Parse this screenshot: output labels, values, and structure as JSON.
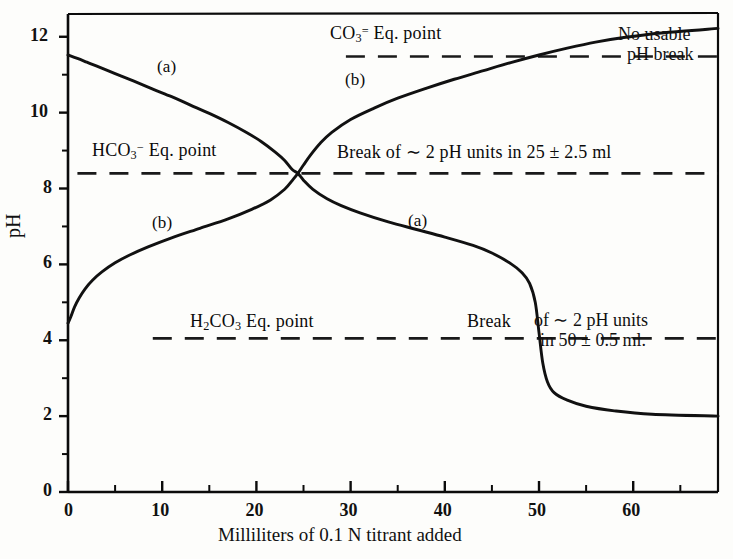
{
  "chart_data": {
    "type": "line",
    "title": "",
    "xlabel": "Milliliters of 0.1 N titrant added",
    "ylabel": "pH",
    "xlim": [
      0,
      69
    ],
    "ylim": [
      0,
      12.6
    ],
    "xticks": [
      0,
      10,
      20,
      30,
      40,
      50,
      60
    ],
    "xtick_labels": [
      "0",
      "10",
      "20",
      "30",
      "40",
      "50",
      "60"
    ],
    "yticks": [
      0,
      2,
      4,
      6,
      8,
      10,
      12
    ],
    "ytick_labels": [
      "0",
      "2",
      "4",
      "6",
      "8",
      "10",
      "12"
    ],
    "minor_xtick_step": 5,
    "minor_ytick_step": 1,
    "grid": false,
    "legend": "inline-curve-labels",
    "series": [
      {
        "name": "(a) titration of carbonate with acid",
        "label": "(a)",
        "label_positions": [
          {
            "x": 16.5,
            "y": 10.85
          },
          {
            "x": 37.5,
            "y": 7.35
          }
        ],
        "points": [
          {
            "x": 0.0,
            "y": 11.52
          },
          {
            "x": 1.0,
            "y": 11.43
          },
          {
            "x": 2.0,
            "y": 11.33
          },
          {
            "x": 3.0,
            "y": 11.23
          },
          {
            "x": 5.0,
            "y": 11.03
          },
          {
            "x": 7.0,
            "y": 10.83
          },
          {
            "x": 9.0,
            "y": 10.62
          },
          {
            "x": 11.0,
            "y": 10.42
          },
          {
            "x": 13.0,
            "y": 10.2
          },
          {
            "x": 15.0,
            "y": 9.98
          },
          {
            "x": 17.0,
            "y": 9.74
          },
          {
            "x": 19.0,
            "y": 9.47
          },
          {
            "x": 20.5,
            "y": 9.24
          },
          {
            "x": 22.0,
            "y": 8.96
          },
          {
            "x": 23.0,
            "y": 8.74
          },
          {
            "x": 23.8,
            "y": 8.5
          },
          {
            "x": 24.4,
            "y": 8.4
          },
          {
            "x": 25.0,
            "y": 8.22
          },
          {
            "x": 26.0,
            "y": 7.98
          },
          {
            "x": 27.5,
            "y": 7.73
          },
          {
            "x": 29.0,
            "y": 7.55
          },
          {
            "x": 31.0,
            "y": 7.36
          },
          {
            "x": 34.0,
            "y": 7.12
          },
          {
            "x": 37.0,
            "y": 6.92
          },
          {
            "x": 40.0,
            "y": 6.72
          },
          {
            "x": 43.0,
            "y": 6.5
          },
          {
            "x": 45.0,
            "y": 6.3
          },
          {
            "x": 47.0,
            "y": 6.02
          },
          {
            "x": 48.2,
            "y": 5.78
          },
          {
            "x": 49.0,
            "y": 5.5
          },
          {
            "x": 49.6,
            "y": 5.0
          },
          {
            "x": 50.0,
            "y": 4.2
          },
          {
            "x": 50.4,
            "y": 3.4
          },
          {
            "x": 50.9,
            "y": 2.9
          },
          {
            "x": 51.6,
            "y": 2.62
          },
          {
            "x": 53.0,
            "y": 2.42
          },
          {
            "x": 55.0,
            "y": 2.26
          },
          {
            "x": 58.0,
            "y": 2.14
          },
          {
            "x": 62.0,
            "y": 2.05
          },
          {
            "x": 69.0,
            "y": 2.0
          }
        ]
      },
      {
        "name": "(b) titration of acid with base",
        "label": "(b)",
        "label_positions": [
          {
            "x": 10.0,
            "y": 7.06
          },
          {
            "x": 29.5,
            "y": 10.62
          }
        ],
        "points": [
          {
            "x": 0.0,
            "y": 4.45
          },
          {
            "x": 0.3,
            "y": 4.62
          },
          {
            "x": 0.7,
            "y": 4.88
          },
          {
            "x": 1.2,
            "y": 5.12
          },
          {
            "x": 1.8,
            "y": 5.35
          },
          {
            "x": 2.6,
            "y": 5.58
          },
          {
            "x": 3.6,
            "y": 5.8
          },
          {
            "x": 5.0,
            "y": 6.04
          },
          {
            "x": 6.5,
            "y": 6.24
          },
          {
            "x": 8.5,
            "y": 6.46
          },
          {
            "x": 11.0,
            "y": 6.7
          },
          {
            "x": 14.0,
            "y": 6.95
          },
          {
            "x": 17.0,
            "y": 7.2
          },
          {
            "x": 19.5,
            "y": 7.45
          },
          {
            "x": 21.5,
            "y": 7.7
          },
          {
            "x": 23.0,
            "y": 7.98
          },
          {
            "x": 23.9,
            "y": 8.24
          },
          {
            "x": 24.4,
            "y": 8.4
          },
          {
            "x": 25.0,
            "y": 8.62
          },
          {
            "x": 25.8,
            "y": 8.9
          },
          {
            "x": 26.8,
            "y": 9.2
          },
          {
            "x": 28.0,
            "y": 9.48
          },
          {
            "x": 30.0,
            "y": 9.82
          },
          {
            "x": 32.5,
            "y": 10.12
          },
          {
            "x": 35.0,
            "y": 10.38
          },
          {
            "x": 38.0,
            "y": 10.64
          },
          {
            "x": 41.0,
            "y": 10.88
          },
          {
            "x": 44.0,
            "y": 11.1
          },
          {
            "x": 47.0,
            "y": 11.32
          },
          {
            "x": 50.0,
            "y": 11.52
          },
          {
            "x": 53.0,
            "y": 11.7
          },
          {
            "x": 56.0,
            "y": 11.86
          },
          {
            "x": 59.0,
            "y": 11.98
          },
          {
            "x": 63.0,
            "y": 12.1
          },
          {
            "x": 69.0,
            "y": 12.22
          }
        ]
      }
    ],
    "reference_lines": [
      {
        "name": "co3-eq-point",
        "y": 11.48,
        "x_start": 29.5,
        "x_end": 69.0,
        "style": "dashed"
      },
      {
        "name": "hco3-eq-point",
        "y": 8.4,
        "x_start": 1.0,
        "x_end": 69.0,
        "style": "dashed"
      },
      {
        "name": "h2co3-eq-point",
        "y": 4.05,
        "x_start": 9.0,
        "x_end": 69.0,
        "style": "dashed"
      }
    ],
    "annotations": [
      {
        "name": "co3-eq-point-label",
        "text": "CO3= Eq. point",
        "x": 36.0,
        "y": 11.95
      },
      {
        "name": "no-usable-ph-break-label",
        "text": "No usable pH break",
        "x": 62.0,
        "y": 11.75
      },
      {
        "name": "hco3-eq-point-label",
        "text": "HCO3- Eq. point",
        "x": 11.0,
        "y": 8.85
      },
      {
        "name": "break-25ml-label",
        "text": "Break of ~ 2 pH units in 25 ± 2.5 ml",
        "x": 44.0,
        "y": 8.85
      },
      {
        "name": "h2co3-eq-point-label",
        "text": "H2CO3 Eq. point",
        "x": 26.0,
        "y": 4.5
      },
      {
        "name": "break-50ml-label",
        "text": "Break of ~ 2 pH units in 50 ± 0.5 ml.",
        "x": 57.0,
        "y": 4.5
      }
    ]
  },
  "axes": {
    "y_axis_title": "pH",
    "x_axis_title": "Milliliters of 0.1 N titrant added",
    "x_tick_labels": [
      "0",
      "10",
      "20",
      "30",
      "40",
      "50",
      "60"
    ],
    "y_tick_labels": [
      "0",
      "2",
      "4",
      "6",
      "8",
      "10",
      "12"
    ]
  },
  "labels": {
    "curve_a_upper": "(a)",
    "curve_a_lower": "(a)",
    "curve_b_lower": "(b)",
    "curve_b_upper": "(b)",
    "co3_eq_prefix": "CO",
    "co3_eq_sub": "3",
    "co3_eq_sup": "=",
    "co3_eq_suffix": " Eq. point",
    "no_usable_line1": "No usable",
    "no_usable_line2": "pH break",
    "hco3_eq_prefix": "HCO",
    "hco3_eq_sub": "3",
    "hco3_eq_sup": "−",
    "hco3_eq_suffix": " Eq. point",
    "break25_text": "Break of ∼ 2 pH units in 25 ± 2.5 ml",
    "h2co3_eq_prefix": "H",
    "h2co3_eq_sub1": "2",
    "h2co3_eq_mid": "CO",
    "h2co3_eq_sub2": "3",
    "h2co3_eq_suffix": " Eq. point",
    "break50_word": "Break",
    "break50_line1": "of ∼ 2 pH units",
    "break50_line2": "in 50 ± 0.5 ml."
  },
  "colors": {
    "ink": "#0b0b0b",
    "background": "#fdfdfb",
    "curve": "#111111",
    "dashed": "#1a1a1a"
  }
}
